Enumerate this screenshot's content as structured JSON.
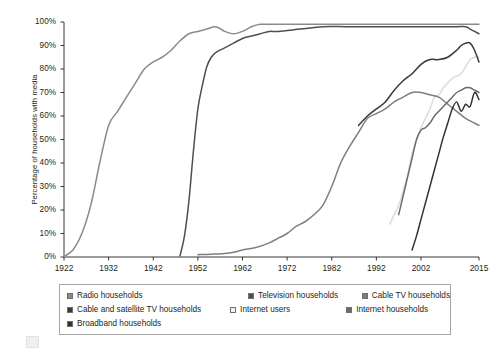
{
  "chart_data": {
    "type": "line",
    "title": "",
    "subtitle": "",
    "xlabel": "",
    "ylabel": "Percentage of households with media",
    "xlim": [
      1922,
      2015
    ],
    "ylim": [
      0,
      100
    ],
    "grid": false,
    "legend_position": "bottom",
    "x_tick_labels": [
      "1922",
      "1932",
      "1942",
      "1952",
      "1962",
      "1972",
      "1982",
      "1992",
      "2002",
      "2015"
    ],
    "x_tick_values": [
      1922,
      1932,
      1942,
      1952,
      1962,
      1972,
      1982,
      1992,
      2002,
      2015
    ],
    "y_tick_labels": [
      "0%",
      "10%",
      "20%",
      "30%",
      "40%",
      "50%",
      "60%",
      "70%",
      "80%",
      "90%",
      "100%"
    ],
    "y_tick_values": [
      0,
      10,
      20,
      30,
      40,
      50,
      60,
      70,
      80,
      90,
      100
    ],
    "series": [
      {
        "name": "Radio households",
        "color": "#8a8a8a",
        "x": [
          1922,
          1924,
          1926,
          1928,
          1930,
          1932,
          1934,
          1936,
          1938,
          1940,
          1942,
          1944,
          1946,
          1948,
          1950,
          1952,
          1954,
          1956,
          1958,
          1960,
          1962,
          1964,
          1966,
          1968,
          1970,
          1975,
          1980,
          1985,
          1990,
          1995,
          2000,
          2005,
          2010,
          2015
        ],
        "values": [
          0.2,
          3,
          10,
          22,
          40,
          56,
          62,
          68,
          74,
          80,
          83,
          85,
          88,
          92,
          95,
          96,
          97,
          98,
          96,
          95,
          96,
          98,
          99,
          99,
          99,
          99,
          99,
          99,
          99,
          99,
          99,
          99,
          99,
          99
        ]
      },
      {
        "name": "Television households",
        "color": "#4f4f4f",
        "x": [
          1948,
          1949,
          1950,
          1951,
          1952,
          1953,
          1954,
          1955,
          1956,
          1958,
          1960,
          1962,
          1964,
          1966,
          1968,
          1970,
          1975,
          1980,
          1985,
          1990,
          1995,
          2000,
          2005,
          2010,
          2012,
          2013,
          2014,
          2015
        ],
        "values": [
          0.5,
          9,
          24,
          45,
          63,
          73,
          81,
          85,
          87,
          89,
          91,
          93,
          94,
          95,
          96,
          96,
          97,
          98,
          98,
          98,
          98,
          98,
          98,
          98,
          98,
          97,
          96,
          95
        ]
      },
      {
        "name": "Cable TV households",
        "color": "#7e7e7e",
        "x": [
          1952,
          1955,
          1958,
          1960,
          1962,
          1965,
          1968,
          1970,
          1972,
          1974,
          1976,
          1978,
          1980,
          1982,
          1984,
          1986,
          1988,
          1990,
          1992,
          1994,
          1996,
          1998,
          2000,
          2002,
          2004,
          2006,
          2008,
          2010,
          2012,
          2015
        ],
        "values": [
          1,
          1.2,
          1.5,
          2,
          3,
          4,
          6,
          8,
          10,
          13,
          15,
          18,
          22,
          30,
          40,
          47,
          53,
          59,
          61,
          63,
          66,
          68,
          70,
          70,
          69,
          68,
          65,
          62,
          59,
          56
        ]
      },
      {
        "name": "Cable and satellite TV households",
        "color": "#3a3a3a",
        "x": [
          1988,
          1990,
          1992,
          1994,
          1996,
          1998,
          2000,
          2002,
          2004,
          2006,
          2008,
          2010,
          2011,
          2012,
          2013,
          2014,
          2015
        ],
        "values": [
          56,
          60,
          63,
          66,
          71,
          75,
          78,
          82,
          84,
          84,
          85,
          88,
          90,
          91,
          91,
          88,
          83
        ]
      },
      {
        "name": "Internet users",
        "color": "#dcdcdc",
        "x": [
          1995,
          1996,
          1997,
          1998,
          1999,
          2000,
          2001,
          2002,
          2003,
          2004,
          2005,
          2006,
          2007,
          2008,
          2009,
          2010,
          2011,
          2012,
          2013,
          2014,
          2015
        ],
        "values": [
          14,
          18,
          22,
          28,
          35,
          44,
          50,
          55,
          59,
          63,
          68,
          69,
          72,
          74,
          76,
          77,
          78,
          81,
          84,
          85,
          85
        ]
      },
      {
        "name": "Internet households",
        "color": "#6b6b6b",
        "x": [
          1997,
          1998,
          1999,
          2000,
          2001,
          2002,
          2003,
          2004,
          2005,
          2006,
          2007,
          2008,
          2009,
          2010,
          2011,
          2012,
          2013,
          2014,
          2015
        ],
        "values": [
          18,
          26,
          34,
          42,
          50,
          54,
          55,
          57,
          60,
          62,
          64,
          66,
          68,
          70,
          71,
          72,
          72,
          71,
          70
        ]
      },
      {
        "name": "Broadband households",
        "color": "#333333",
        "x": [
          2000,
          2001,
          2002,
          2003,
          2004,
          2005,
          2006,
          2007,
          2008,
          2009,
          2010,
          2011,
          2012,
          2013,
          2014,
          2015
        ],
        "values": [
          3,
          9,
          16,
          23,
          30,
          37,
          44,
          51,
          57,
          63,
          66,
          62,
          65,
          64,
          70,
          67
        ]
      }
    ]
  },
  "axes": {
    "y_label": "Percentage of households with media",
    "y_ticks": [
      "100%",
      "90%",
      "80%",
      "70%",
      "60%",
      "50%",
      "40%",
      "30%",
      "20%",
      "10%",
      "0%"
    ],
    "x_ticks": [
      "1922",
      "1932",
      "1942",
      "1952",
      "1962",
      "1972",
      "1982",
      "1992",
      "2002",
      "2015"
    ]
  },
  "legend": {
    "rows": [
      [
        {
          "label": "Radio households",
          "color": "#8a8a8a"
        },
        {
          "label": "Television households",
          "color": "#4f4f4f"
        },
        {
          "label": "Cable TV households",
          "color": "#7e7e7e"
        }
      ],
      [
        {
          "label": "Cable and satellite TV households",
          "color": "#3a3a3a"
        },
        {
          "label": "Internet users",
          "color": "#f4f4f4"
        },
        {
          "label": "Internet households",
          "color": "#6b6b6b"
        }
      ],
      [
        {
          "label": "Broadband households",
          "color": "#333333"
        }
      ]
    ]
  }
}
